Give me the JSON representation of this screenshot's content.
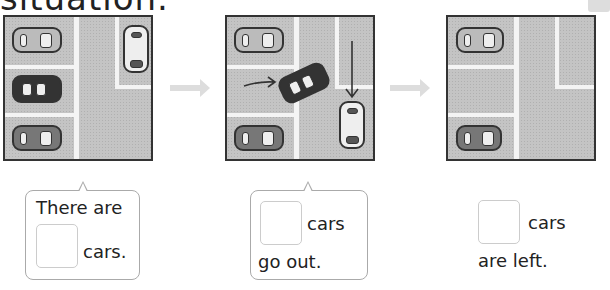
{
  "header": {
    "title": "situation."
  },
  "panels": [
    {
      "id": "start",
      "description": "parking lot with 4 cars parked"
    },
    {
      "id": "leaving",
      "description": "2 cars driving out (arrows indicate movement)"
    },
    {
      "id": "end",
      "description": "parking lot with 2 cars left"
    }
  ],
  "captions": {
    "first": {
      "line1": "There are",
      "line2": "cars."
    },
    "second": {
      "line1": "cars",
      "line2": "go out."
    },
    "third": {
      "line1": "cars",
      "line2": "are left."
    }
  },
  "colors": {
    "asphalt": "#c4c4c4",
    "lane": "#f4f4f4",
    "bubble_border": "#aaaaaa",
    "answer_box_border": "#cccccc",
    "flow_arrow": "#dddddd"
  }
}
